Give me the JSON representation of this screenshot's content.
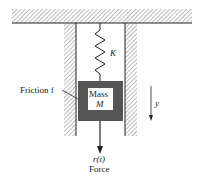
{
  "diagram": {
    "spring_label": "K",
    "friction_label": "Friction f",
    "mass_label": "Mass",
    "mass_symbol": "M",
    "direction_label": "y",
    "force_symbol": "r(t)",
    "force_label": "Force"
  },
  "colors": {
    "mass_fill": "#555555",
    "line": "#222222",
    "hatch": "#888888"
  }
}
